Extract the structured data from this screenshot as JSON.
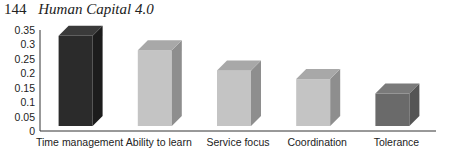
{
  "header": {
    "page_number": "144",
    "book_title": "Human Capital 4.0"
  },
  "chart_data": {
    "type": "bar",
    "style": "3d-column",
    "title": "",
    "xlabel": "",
    "ylabel": "",
    "categories": [
      "Time management",
      "Ability to learn",
      "Service focus",
      "Coordination",
      "Tolerance"
    ],
    "values": [
      0.33,
      0.28,
      0.21,
      0.18,
      0.13
    ],
    "colors": {
      "front": [
        "#2b2b2b",
        "#c4c4c4",
        "#c4c4c4",
        "#c4c4c4",
        "#6a6a6a"
      ],
      "side": [
        "#1c1c1c",
        "#8e8e8e",
        "#8e8e8e",
        "#8e8e8e",
        "#555555"
      ],
      "top": [
        "#3a3a3a",
        "#a8a8a8",
        "#a8a8a8",
        "#a8a8a8",
        "#7a7a7a"
      ]
    },
    "ylim": [
      0,
      0.35
    ],
    "yticks": [
      "0",
      "0.05",
      "0.1",
      "0.15",
      "0.2",
      "0.25",
      "0.3",
      "0.35"
    ],
    "grid": false,
    "legend": null
  }
}
